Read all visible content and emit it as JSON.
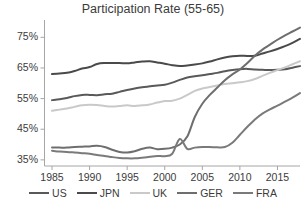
{
  "chart_data": {
    "type": "line",
    "title": "Participation Rate (55-65)",
    "xlabel": "",
    "ylabel": "",
    "xlim": [
      1984,
      2018
    ],
    "ylim": [
      33,
      80
    ],
    "grid": false,
    "legend_position": "bottom",
    "x_ticks": [
      1985,
      1990,
      1995,
      2000,
      2005,
      2010,
      2015
    ],
    "x_tick_labels": [
      "1985",
      "1990",
      "1995",
      "2000",
      "2005",
      "2010",
      "2015"
    ],
    "y_ticks": [
      35,
      45,
      55,
      65,
      75
    ],
    "y_tick_labels": [
      "35%",
      "45%",
      "55%",
      "65%",
      "75%"
    ],
    "x": [
      1985,
      1986,
      1987,
      1988,
      1989,
      1990,
      1991,
      1992,
      1993,
      1994,
      1995,
      1996,
      1997,
      1998,
      1999,
      2000,
      2001,
      2002,
      2003,
      2004,
      2005,
      2006,
      2007,
      2008,
      2009,
      2010,
      2011,
      2012,
      2013,
      2014,
      2015,
      2016,
      2017,
      2018
    ],
    "series": [
      {
        "name": "US",
        "color": "#595959",
        "values": [
          54.5,
          54.8,
          55.2,
          55.8,
          56.2,
          56.2,
          56.1,
          56.4,
          56.6,
          57.2,
          57.8,
          58.3,
          58.7,
          59.0,
          59.3,
          59.5,
          60.2,
          61.1,
          61.9,
          62.3,
          62.6,
          63.0,
          63.4,
          63.9,
          64.3,
          64.6,
          64.7,
          64.5,
          64.4,
          64.3,
          64.4,
          64.6,
          65.1,
          65.6
        ]
      },
      {
        "name": "JPN",
        "color": "#4a4a4a",
        "values": [
          63.0,
          63.2,
          63.4,
          64.0,
          64.8,
          65.3,
          66.3,
          66.6,
          66.6,
          66.6,
          66.5,
          66.8,
          67.1,
          67.2,
          66.8,
          66.4,
          65.9,
          65.6,
          65.8,
          66.1,
          66.5,
          67.1,
          67.8,
          68.4,
          68.8,
          69.0,
          68.9,
          69.0,
          69.7,
          70.4,
          71.2,
          72.1,
          73.2,
          74.5
        ]
      },
      {
        "name": "UK",
        "color": "#c9c9c9",
        "values": [
          51.0,
          51.4,
          51.8,
          52.3,
          52.8,
          53.0,
          52.9,
          52.6,
          52.4,
          52.6,
          52.8,
          52.6,
          52.8,
          53.1,
          53.7,
          54.2,
          54.3,
          55.0,
          56.2,
          57.5,
          58.3,
          58.8,
          59.3,
          59.8,
          60.0,
          60.3,
          60.7,
          61.4,
          62.4,
          63.4,
          64.3,
          65.2,
          66.2,
          67.2
        ]
      },
      {
        "name": "GER",
        "color": "#6e6e6e",
        "values": [
          39.0,
          39.0,
          39.0,
          39.2,
          39.3,
          39.4,
          39.6,
          39.2,
          38.3,
          37.6,
          37.4,
          37.8,
          38.6,
          39.0,
          38.5,
          38.6,
          39.0,
          40.0,
          42.6,
          49.0,
          53.3,
          56.2,
          58.6,
          61.0,
          62.9,
          64.5,
          66.6,
          69.0,
          71.0,
          72.6,
          74.2,
          75.6,
          76.9,
          78.2
        ]
      },
      {
        "name": "FRA",
        "color": "#7a7a7a",
        "values": [
          38.0,
          37.7,
          37.6,
          37.4,
          37.2,
          37.0,
          36.6,
          36.3,
          35.9,
          35.6,
          35.5,
          35.5,
          35.7,
          36.0,
          36.3,
          36.2,
          37.0,
          41.8,
          38.6,
          39.0,
          39.2,
          39.2,
          39.1,
          39.2,
          40.6,
          43.2,
          45.8,
          48.2,
          50.1,
          51.5,
          52.7,
          54.0,
          55.3,
          56.8
        ]
      }
    ]
  },
  "axis": {
    "line_color": "#a6a6a6",
    "tick_color": "#a6a6a6"
  }
}
